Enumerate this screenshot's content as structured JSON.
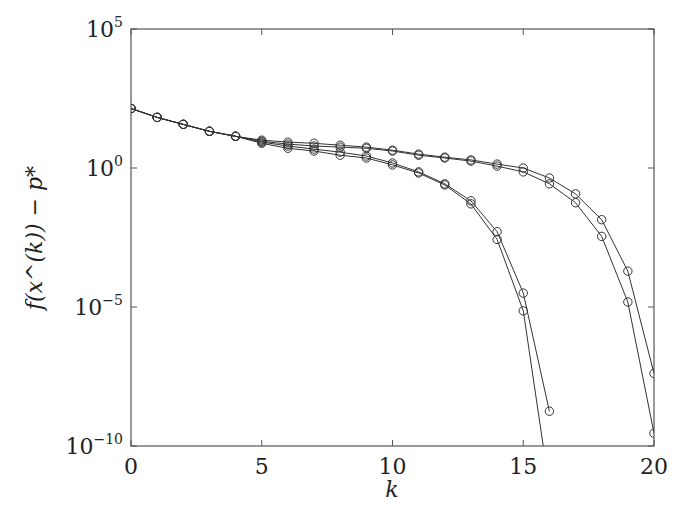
{
  "chart_data": {
    "type": "line",
    "title": "",
    "xlabel": "k",
    "ylabel": "f(x^(k)) − p*",
    "yscale": "log",
    "xlim": [
      0,
      20
    ],
    "ylim": [
      1e-10,
      100000.0
    ],
    "xticks": [
      0,
      5,
      10,
      15,
      20
    ],
    "yticks": [
      {
        "base": "10",
        "exp": "5",
        "value": 5
      },
      {
        "base": "10",
        "exp": "0",
        "value": 0
      },
      {
        "base": "10",
        "exp": "−5",
        "value": -5
      },
      {
        "base": "10",
        "exp": "−10",
        "value": -10
      }
    ],
    "grid": false,
    "legend": null,
    "marker": "open-circle",
    "line_color": "#333333",
    "note": "values are log10 of f(x^(k)) - p*",
    "series": [
      {
        "name": "series-1",
        "x": [
          0,
          1,
          2,
          3,
          4,
          5,
          6,
          7,
          8,
          9,
          10,
          11,
          12,
          13,
          14,
          15,
          16,
          17,
          18,
          19,
          20
        ],
        "log10_values": [
          2.14,
          1.82,
          1.57,
          1.32,
          1.14,
          1.0,
          0.93,
          0.89,
          0.82,
          0.75,
          0.64,
          0.5,
          0.39,
          0.29,
          0.14,
          0.0,
          -0.36,
          -0.93,
          -1.86,
          -3.71,
          -7.39
        ]
      },
      {
        "name": "series-2",
        "x": [
          0,
          1,
          2,
          3,
          4,
          5,
          6,
          7,
          8,
          9,
          10,
          11,
          12,
          13,
          14,
          15,
          16,
          17,
          18,
          19,
          20
        ],
        "log10_values": [
          2.14,
          1.82,
          1.57,
          1.32,
          1.14,
          0.96,
          0.86,
          0.79,
          0.75,
          0.71,
          0.61,
          0.46,
          0.36,
          0.25,
          0.07,
          -0.14,
          -0.57,
          -1.25,
          -2.46,
          -4.82,
          -9.54
        ]
      },
      {
        "name": "series-3",
        "x": [
          0,
          1,
          2,
          3,
          4,
          5,
          6,
          7,
          8,
          9,
          10,
          11,
          12,
          13,
          14,
          15,
          16
        ],
        "log10_values": [
          2.14,
          1.82,
          1.57,
          1.32,
          1.14,
          0.93,
          0.79,
          0.68,
          0.57,
          0.43,
          0.18,
          -0.14,
          -0.57,
          -1.18,
          -2.29,
          -4.5,
          -8.75
        ]
      },
      {
        "name": "series-4",
        "x": [
          0,
          1,
          2,
          3,
          4,
          5,
          6,
          7,
          8,
          9,
          10,
          11,
          12,
          13,
          14,
          15,
          16
        ],
        "log10_values": [
          2.14,
          1.82,
          1.57,
          1.32,
          1.14,
          0.89,
          0.71,
          0.61,
          0.46,
          0.36,
          0.11,
          -0.18,
          -0.61,
          -1.29,
          -2.57,
          -5.14,
          -11.5
        ]
      }
    ]
  },
  "plot_area": {
    "left": 131,
    "top": 29,
    "right": 654,
    "bottom": 446
  }
}
